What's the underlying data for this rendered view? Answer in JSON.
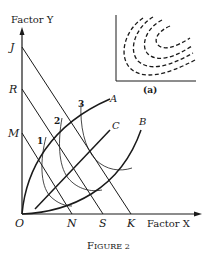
{
  "figure": {
    "caption": "Figure 2",
    "caption_display": "FIGURE 2",
    "axes": {
      "y_label": "Factor Y",
      "x_label": "Factor X",
      "origin_label": "O"
    },
    "y_axis_points": [
      "J",
      "R",
      "M"
    ],
    "x_axis_points": [
      "N",
      "S",
      "K"
    ],
    "isocost_lines": [
      {
        "from": "J",
        "to": "K"
      },
      {
        "from": "R",
        "to": "S"
      },
      {
        "from": "M",
        "to": "N"
      }
    ],
    "expansion_paths": [
      "A",
      "C",
      "B"
    ],
    "isoquant_labels": [
      "1",
      "2",
      "3"
    ],
    "inset": {
      "label": "(a)",
      "description": "dashed concentric elliptical isoquant contours"
    }
  },
  "labels": {
    "J": "J",
    "R": "R",
    "M": "M",
    "N": "N",
    "S": "S",
    "K": "K",
    "O": "O",
    "A": "A",
    "B": "B",
    "C": "C",
    "n1": "1",
    "n2": "2",
    "n3": "3",
    "factor_y": "Factor Y",
    "factor_x": "Factor X",
    "inset": "(a)",
    "caption_first": "F",
    "caption_rest": "IGURE 2"
  }
}
